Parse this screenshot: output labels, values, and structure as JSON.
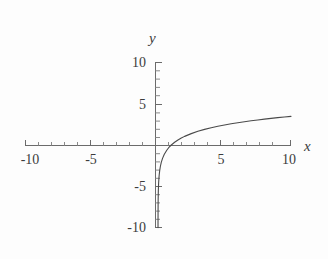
{
  "chart_data": {
    "type": "line",
    "title": "",
    "subtitle": "",
    "xlabel": "x",
    "ylabel": "y",
    "xlim": [
      -10,
      10
    ],
    "ylim": [
      -10,
      10
    ],
    "grid": false,
    "legend": null,
    "axis_style": "centered-cross",
    "x_ticks_major": [
      -10,
      -5,
      5,
      10
    ],
    "x_ticks_major_labels": [
      "-10",
      "-5",
      "5",
      "10"
    ],
    "y_ticks_major": [
      -10,
      -5,
      5,
      10
    ],
    "y_ticks_major_labels": [
      "-10",
      "-5",
      "5",
      "10"
    ],
    "x_ticks_minor": [
      -9,
      -8,
      -7,
      -6,
      -4,
      -3,
      -2,
      -1,
      1,
      2,
      3,
      4,
      6,
      7,
      8,
      9
    ],
    "y_ticks_minor": [
      -9,
      -8,
      -7,
      -6,
      -4,
      -3,
      -2,
      -1,
      1,
      2,
      3,
      4,
      6,
      7,
      8,
      9
    ],
    "series": [
      {
        "name": "y = 1.5 ln(x)",
        "color": "#4a4a4a",
        "x": [
          0.0013,
          0.0018,
          0.0025,
          0.0034,
          0.0048,
          0.0067,
          0.0092,
          0.0128,
          0.0178,
          0.0247,
          0.0343,
          0.0476,
          0.0661,
          0.0918,
          0.1275,
          0.1771,
          0.2459,
          0.3415,
          0.4742,
          0.6586,
          0.8,
          1.0,
          1.25,
          1.5,
          1.75,
          2.0,
          2.5,
          3.0,
          3.5,
          4.0,
          4.5,
          5.0,
          5.5,
          6.0,
          6.5,
          7.0,
          7.5,
          8.0,
          8.5,
          9.0,
          9.5,
          10.0
        ],
        "y": [
          -9.95,
          -9.46,
          -8.97,
          -8.5,
          -7.99,
          -7.5,
          -7.03,
          -6.54,
          -6.04,
          -5.55,
          -5.05,
          -4.56,
          -4.08,
          -3.58,
          -3.09,
          -2.59,
          -2.1,
          -1.61,
          -1.12,
          -0.63,
          -0.33,
          0.0,
          0.33,
          0.61,
          0.84,
          1.04,
          1.37,
          1.65,
          1.88,
          2.08,
          2.26,
          2.41,
          2.56,
          2.69,
          2.81,
          2.92,
          3.02,
          3.12,
          3.21,
          3.3,
          3.38,
          3.45
        ],
        "linewidth": 1.1,
        "style": "solid"
      }
    ],
    "annotations": []
  },
  "labels": {
    "y_axis_name": "y",
    "x_axis_name": "x",
    "y_top": "10",
    "y_mid_pos": "5",
    "y_mid_neg": "-5",
    "y_bottom": "-10",
    "x_left": "-10",
    "x_mid_neg": "-5",
    "x_mid_pos": "5",
    "x_right": "10"
  },
  "colors": {
    "curve": "#4a4a4a",
    "axis": "#6b6b6b",
    "text": "#3c3c3c",
    "background": "#fdfdfd"
  }
}
